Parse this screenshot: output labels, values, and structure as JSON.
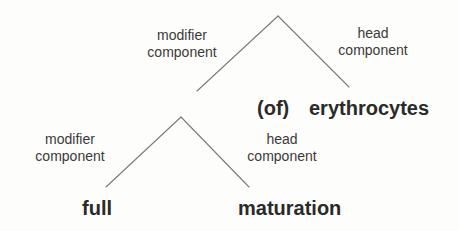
{
  "diagram": {
    "type": "tree",
    "nodes": {
      "top": {
        "left_label": [
          "modifier",
          "component"
        ],
        "right_label": [
          "head",
          "component"
        ],
        "head_words": {
          "preposition": "(of)",
          "word": "erythrocytes"
        }
      },
      "sub": {
        "left_label": [
          "modifier",
          "component"
        ],
        "right_label": [
          "head",
          "component"
        ],
        "left_word": "full",
        "right_word": "maturation"
      }
    },
    "colors": {
      "line": "#7a7a7a",
      "label_text": "#3a3a3a",
      "word_text": "#2a2a2a",
      "background": "#fdfdfb"
    }
  }
}
